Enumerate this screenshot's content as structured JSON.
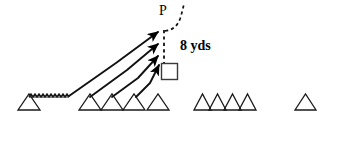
{
  "diagram": {
    "kind": "football-play-diagram",
    "background_color": "#ffffff",
    "ink_color": "#000000",
    "width": 337,
    "height": 150,
    "labels": {
      "passer_label": "P",
      "depth_label": "8 yds"
    },
    "annotations": {
      "depth_line": {
        "style": "dashed",
        "from": [
          163,
          30
        ],
        "to": [
          163,
          63
        ],
        "meaning": "8 yds drop depth"
      },
      "rollout_path": {
        "style": "dashed-curve",
        "from": [
          165,
          31
        ],
        "to": [
          186,
          5
        ],
        "meaning": "passer movement"
      }
    },
    "shapes": {
      "quarterback_box": {
        "type": "square",
        "x": 161,
        "y": 63,
        "size": 17,
        "fill": "none",
        "stroke": "#000000"
      },
      "motion_squiggle": {
        "type": "zigzag",
        "from": [
          29,
          96
        ],
        "to": [
          69,
          96
        ],
        "meaning": "jet motion / shift"
      }
    },
    "triangle_groups": [
      {
        "name": "left-lone-player",
        "count": 1,
        "positions": [
          {
            "x": 18,
            "y": 94,
            "w": 22,
            "h": 16
          }
        ]
      },
      {
        "name": "rushing-line",
        "count": 4,
        "positions": [
          {
            "x": 79,
            "y": 94,
            "w": 22,
            "h": 16
          },
          {
            "x": 101,
            "y": 94,
            "w": 22,
            "h": 16
          },
          {
            "x": 123,
            "y": 94,
            "w": 22,
            "h": 16
          },
          {
            "x": 147,
            "y": 94,
            "w": 22,
            "h": 16
          }
        ]
      },
      {
        "name": "blocking-line",
        "count": 4,
        "positions": [
          {
            "x": 194,
            "y": 94,
            "w": 17,
            "h": 16
          },
          {
            "x": 209,
            "y": 94,
            "w": 17,
            "h": 16
          },
          {
            "x": 224,
            "y": 94,
            "w": 17,
            "h": 16
          },
          {
            "x": 239,
            "y": 94,
            "w": 17,
            "h": 16
          }
        ]
      },
      {
        "name": "right-lone-player",
        "count": 1,
        "positions": [
          {
            "x": 295,
            "y": 94,
            "w": 21,
            "h": 16
          }
        ]
      }
    ],
    "arrows": [
      {
        "name": "rush-arrow-1",
        "path": "M 69,96 L 115,63 L 161,31",
        "tip": [
          161,
          31
        ]
      },
      {
        "name": "rush-arrow-2",
        "path": "M 90,96 L 125,70 L 161,43",
        "tip": [
          161,
          43
        ]
      },
      {
        "name": "rush-arrow-3",
        "path": "M 112,96 L 137,78 L 161,55",
        "tip": [
          161,
          55
        ]
      },
      {
        "name": "rush-arrow-4",
        "path": "M 136,96 L 150,82 L 162,64",
        "tip": [
          162,
          64
        ]
      }
    ]
  }
}
